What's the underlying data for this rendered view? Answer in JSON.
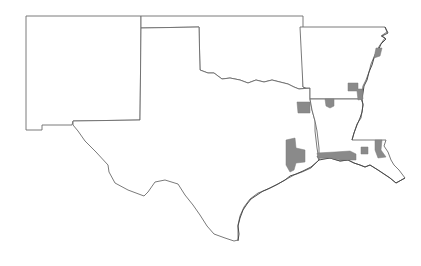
{
  "map": {
    "states": [
      {
        "id": "new-mexico",
        "name": "New Mexico"
      },
      {
        "id": "texas",
        "name": "Texas"
      },
      {
        "id": "oklahoma",
        "name": "Oklahoma"
      },
      {
        "id": "arkansas",
        "name": "Arkansas"
      },
      {
        "id": "louisiana",
        "name": "Louisiana"
      }
    ],
    "colors": {
      "background": "#ffffff",
      "border": "#6b6b6b",
      "highlight_fill": "#8a8a8a"
    },
    "highlighted_regions": [
      {
        "id": "ne-arkansas"
      },
      {
        "id": "se-arkansas"
      },
      {
        "id": "ne-texas"
      },
      {
        "id": "n-louisiana"
      },
      {
        "id": "se-texas"
      },
      {
        "id": "sw-louisiana"
      },
      {
        "id": "s-louisiana-small"
      },
      {
        "id": "se-louisiana"
      }
    ]
  }
}
